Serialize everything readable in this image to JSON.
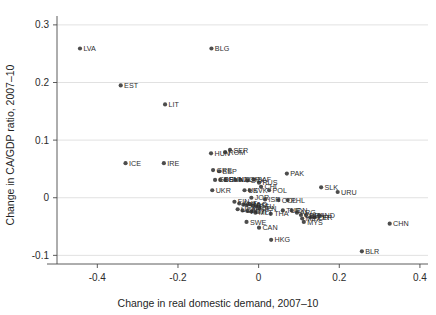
{
  "chart_data": {
    "type": "scatter",
    "title": "",
    "xlabel": "Change in real domestic demand, 2007–10",
    "ylabel": "Change in CA/GDP ratio, 2007–10",
    "xlim": [
      -0.5,
      0.42
    ],
    "ylim": [
      -0.115,
      0.305
    ],
    "xticks": [
      -0.4,
      -0.2,
      0,
      0.2,
      0.4
    ],
    "xticklabels": [
      "-0.4",
      "-0.2",
      "0",
      "0.2",
      "0.4"
    ],
    "yticks": [
      -0.1,
      0,
      0.1,
      0.2,
      0.3
    ],
    "yticklabels": [
      "-0.1",
      "0",
      "0.1",
      "0.2",
      "0.3"
    ],
    "grid": "horizontal",
    "legend": "none",
    "marker_color": "#4d4d4d",
    "points": [
      {
        "label": "LVA",
        "x": -0.443,
        "y": 0.259
      },
      {
        "label": "EST",
        "x": -0.342,
        "y": 0.195
      },
      {
        "label": "LIT",
        "x": -0.232,
        "y": 0.162
      },
      {
        "label": "BLG",
        "x": -0.117,
        "y": 0.259
      },
      {
        "label": "HUN",
        "x": -0.118,
        "y": 0.077
      },
      {
        "label": "ROM",
        "x": -0.083,
        "y": 0.079
      },
      {
        "label": "SER",
        "x": -0.071,
        "y": 0.083
      },
      {
        "label": "ICE",
        "x": -0.33,
        "y": 0.06
      },
      {
        "label": "IRE",
        "x": -0.235,
        "y": 0.06
      },
      {
        "label": "GRE",
        "x": -0.113,
        "y": 0.048
      },
      {
        "label": "ESP",
        "x": -0.098,
        "y": 0.046
      },
      {
        "label": "UKR",
        "x": -0.115,
        "y": 0.013
      },
      {
        "label": "GBR",
        "x": -0.108,
        "y": 0.031
      },
      {
        "label": "DEN",
        "x": -0.095,
        "y": 0.031
      },
      {
        "label": "SVN",
        "x": -0.082,
        "y": 0.031
      },
      {
        "label": "NZL",
        "x": -0.058,
        "y": 0.031
      },
      {
        "label": "NOR",
        "x": -0.045,
        "y": 0.031
      },
      {
        "label": "SVK",
        "x": -0.028,
        "y": 0.03
      },
      {
        "label": "SAF",
        "x": -0.012,
        "y": 0.032
      },
      {
        "label": "RUS",
        "x": 0.001,
        "y": 0.026
      },
      {
        "label": "UK",
        "x": -0.035,
        "y": 0.013
      },
      {
        "label": "SVK2",
        "x": -0.022,
        "y": 0.013
      },
      {
        "label": "CHI",
        "x": 0.006,
        "y": 0.019
      },
      {
        "label": "POL",
        "x": 0.026,
        "y": 0.013
      },
      {
        "label": "PAK",
        "x": 0.07,
        "y": 0.042
      },
      {
        "label": "SLK",
        "x": 0.155,
        "y": 0.018
      },
      {
        "label": "URU",
        "x": 0.196,
        "y": 0.01
      },
      {
        "label": "JOR",
        "x": -0.018,
        "y": 0.0
      },
      {
        "label": "ISR",
        "x": 0.016,
        "y": -0.003
      },
      {
        "label": "COL",
        "x": 0.049,
        "y": -0.004
      },
      {
        "label": "PHL",
        "x": 0.072,
        "y": -0.004
      },
      {
        "label": "FIN",
        "x": -0.06,
        "y": -0.007
      },
      {
        "label": "AUT",
        "x": -0.048,
        "y": -0.01
      },
      {
        "label": "FRA",
        "x": -0.038,
        "y": -0.012
      },
      {
        "label": "ITA",
        "x": -0.03,
        "y": -0.013
      },
      {
        "label": "NLD",
        "x": -0.022,
        "y": -0.011
      },
      {
        "label": "BEL",
        "x": -0.014,
        "y": -0.014
      },
      {
        "label": "DEU",
        "x": -0.006,
        "y": -0.015
      },
      {
        "label": "JPN",
        "x": 0.002,
        "y": -0.018
      },
      {
        "label": "USA",
        "x": -0.052,
        "y": -0.02
      },
      {
        "label": "CZE",
        "x": -0.04,
        "y": -0.022
      },
      {
        "label": "PRT",
        "x": -0.028,
        "y": -0.023
      },
      {
        "label": "CYP",
        "x": -0.018,
        "y": -0.024
      },
      {
        "label": "MLT",
        "x": -0.008,
        "y": -0.026
      },
      {
        "label": "THA",
        "x": 0.03,
        "y": -0.028
      },
      {
        "label": "TUR",
        "x": 0.06,
        "y": -0.022
      },
      {
        "label": "IDN",
        "x": 0.082,
        "y": -0.022
      },
      {
        "label": "ARG",
        "x": 0.095,
        "y": -0.026
      },
      {
        "label": "CHL",
        "x": 0.105,
        "y": -0.03
      },
      {
        "label": "BRA",
        "x": 0.118,
        "y": -0.03
      },
      {
        "label": "IND",
        "x": 0.15,
        "y": -0.03
      },
      {
        "label": "KOR",
        "x": 0.128,
        "y": -0.034
      },
      {
        "label": "PER",
        "x": 0.138,
        "y": -0.034
      },
      {
        "label": "MEX",
        "x": 0.108,
        "y": -0.036
      },
      {
        "label": "MYS",
        "x": 0.112,
        "y": -0.042
      },
      {
        "label": "SWE",
        "x": -0.03,
        "y": -0.042
      },
      {
        "label": "CAN",
        "x": 0.001,
        "y": -0.052
      },
      {
        "label": "HKG",
        "x": 0.031,
        "y": -0.073
      },
      {
        "label": "CHN",
        "x": 0.325,
        "y": -0.045
      },
      {
        "label": "BLR",
        "x": 0.256,
        "y": -0.093
      }
    ],
    "visible_labels": [
      "LVA",
      "EST",
      "LIT",
      "BLG",
      "HUN",
      "ROM",
      "SER",
      "ICE",
      "IRE",
      "GRE",
      "ESP",
      "UKR",
      "GBR",
      "DEN",
      "SVN",
      "NZL",
      "NOR",
      "SVK",
      "SAF",
      "RUS",
      "UK",
      "CHI",
      "POL",
      "PAK",
      "SLK",
      "URU",
      "JOR",
      "ISR",
      "COL",
      "PHL",
      "FIN",
      "AUT",
      "FRA",
      "ITA",
      "NLD",
      "BEL",
      "DEU",
      "JPN",
      "USA",
      "CZE",
      "PRT",
      "CYP",
      "MLT",
      "THA",
      "TUR",
      "IDN",
      "ARG",
      "CHL",
      "BRA",
      "IND",
      "KOR",
      "PER",
      "MEX",
      "MYS",
      "SWE",
      "CAN",
      "HKG",
      "CHN",
      "BLR"
    ]
  }
}
